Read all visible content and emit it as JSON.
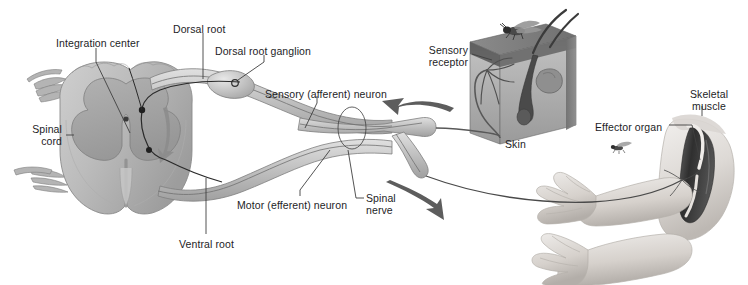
{
  "figure": {
    "background_color": "#ffffff",
    "text_color": "#1d1d1f",
    "palette": {
      "cord_gray": "#b9b9b9",
      "gray_matter": "#a3a3a3",
      "nerve_gray": "#c9c9c9",
      "nerve_outline": "#7d7d7d",
      "skin_dark": "#6f6f6f",
      "skin_mid": "#9e9e9e",
      "skin_light": "#c6c6c6",
      "arm_light": "#e3e0dd",
      "muscle_dark": "#3b3b3b",
      "leader_line": "#4a4a4a",
      "arrow_gray": "#5a5a5a"
    }
  },
  "labels": [
    {
      "id": "integration-center",
      "text": "Integration center",
      "x": 56,
      "y": 37,
      "align": "left"
    },
    {
      "id": "dorsal-root",
      "text": "Dorsal root",
      "x": 173,
      "y": 23,
      "align": "left"
    },
    {
      "id": "dorsal-root-ganglion",
      "text": "Dorsal root ganglion",
      "x": 215,
      "y": 45,
      "align": "left"
    },
    {
      "id": "sensory-neuron",
      "text": "Sensory (afferent) neuron",
      "x": 265,
      "y": 88,
      "align": "left"
    },
    {
      "id": "sensory-receptor",
      "text": "Sensory\nreceptor",
      "x": 405,
      "y": 44,
      "align": "right",
      "width": 63
    },
    {
      "id": "skin",
      "text": "Skin",
      "x": 505,
      "y": 138,
      "align": "left"
    },
    {
      "id": "skeletal-muscle",
      "text": "Skeletal\nmuscle",
      "x": 681,
      "y": 88,
      "align": "center",
      "width": 56
    },
    {
      "id": "effector-organ",
      "text": "Effector organ",
      "x": 595,
      "y": 121,
      "align": "left"
    },
    {
      "id": "spinal-cord",
      "text": "Spinal\ncord",
      "x": 20,
      "y": 123,
      "align": "right",
      "width": 42
    },
    {
      "id": "motor-neuron",
      "text": "Motor (efferent) neuron",
      "x": 237,
      "y": 199,
      "align": "left"
    },
    {
      "id": "spinal-nerve",
      "text": "Spinal\nnerve",
      "x": 366,
      "y": 192,
      "align": "left",
      "width": 40
    },
    {
      "id": "ventral-root",
      "text": "Ventral root",
      "x": 179,
      "y": 238,
      "align": "left"
    }
  ],
  "structures": [
    {
      "id": "spinal-cord-cross-section",
      "description": "Transverse section of spinal cord with butterfly-shaped gray matter and central canal"
    },
    {
      "id": "dorsal-root-ganglion-body",
      "description": "Swelling on dorsal root containing sensory cell body"
    },
    {
      "id": "spinal-nerve-trunk",
      "description": "Mixed spinal nerve branching into dorsal and ventral rootlets"
    },
    {
      "id": "skin-block",
      "description": "Cutaway block of skin with hair follicle, sebaceous gland and free nerve endings"
    },
    {
      "id": "fly-on-skin",
      "description": "Fly resting on skin surface as stimulus"
    },
    {
      "id": "arm-relaxed",
      "description": "Lower arm and hand in resting position"
    },
    {
      "id": "arm-flexed",
      "description": "Arm with skeletal muscle exposed, contracting"
    },
    {
      "id": "fly-near-hand",
      "description": "Second fly hovering near the hand"
    },
    {
      "id": "afferent-arrow",
      "description": "Curved arrow showing impulse travelling toward the spinal cord"
    },
    {
      "id": "efferent-arrow",
      "description": "Curved arrow showing impulse travelling toward the effector"
    },
    {
      "id": "intra-cord-arrow",
      "description": "Arrow inside gray matter showing signal passing to ventral horn"
    }
  ]
}
